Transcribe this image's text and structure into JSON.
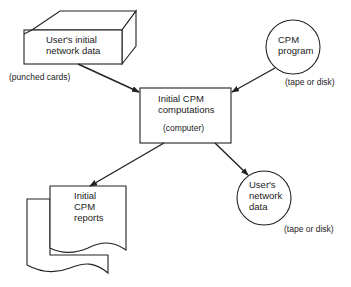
{
  "nodes": {
    "input_cards": {
      "lines": [
        "User's initial",
        "network data"
      ],
      "medium": "(punched cards)"
    },
    "cpm_program": {
      "lines": [
        "CPM",
        "program"
      ],
      "medium": "(tape or disk)"
    },
    "computations": {
      "lines": [
        "Initial CPM",
        "computations"
      ],
      "medium": "(computer)"
    },
    "reports": {
      "lines": [
        "Initial",
        "CPM",
        "reports"
      ]
    },
    "network_data": {
      "lines": [
        "User's",
        "network",
        "data"
      ],
      "medium": "(tape or disk)"
    }
  },
  "edges": [
    {
      "from": "input_cards",
      "to": "computations"
    },
    {
      "from": "cpm_program",
      "to": "computations"
    },
    {
      "from": "computations",
      "to": "reports"
    },
    {
      "from": "computations",
      "to": "network_data"
    }
  ]
}
